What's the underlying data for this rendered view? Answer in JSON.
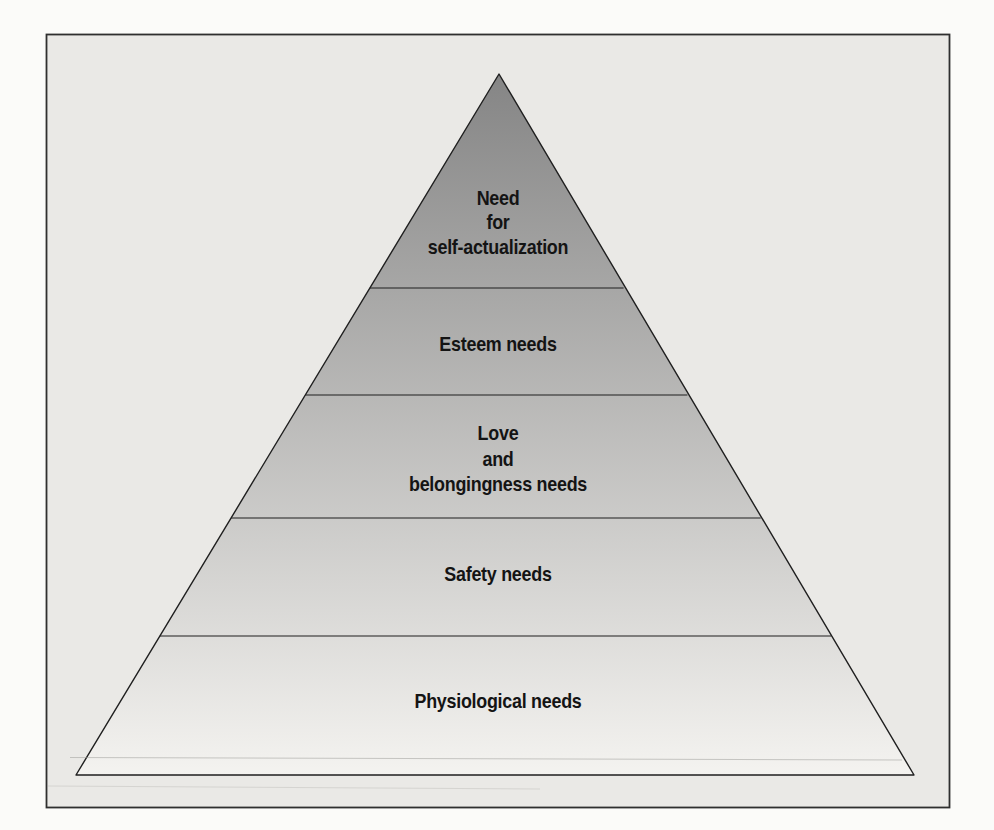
{
  "figure": {
    "levels": [
      {
        "name": "self-actualization",
        "label_lines": [
          "Need",
          "for",
          "self-actualization"
        ]
      },
      {
        "name": "esteem",
        "label_lines": [
          "Esteem needs"
        ]
      },
      {
        "name": "love-belongingness",
        "label_lines": [
          "Love",
          "and",
          "belongingness needs"
        ]
      },
      {
        "name": "safety",
        "label_lines": [
          "Safety needs"
        ]
      },
      {
        "name": "physiological",
        "label_lines": [
          "Physiological needs"
        ]
      }
    ]
  },
  "colors": {
    "gradient_top": "#858585",
    "gradient_bottom": "#f4f3f0",
    "pyramid_outline": "#1f1f1f",
    "divider_line": "#1f1f1f",
    "panel_background": "#eae9e6",
    "page_background": "#fbfbf9",
    "frame_border": "#2f2f2f",
    "label_text": "#141414"
  }
}
